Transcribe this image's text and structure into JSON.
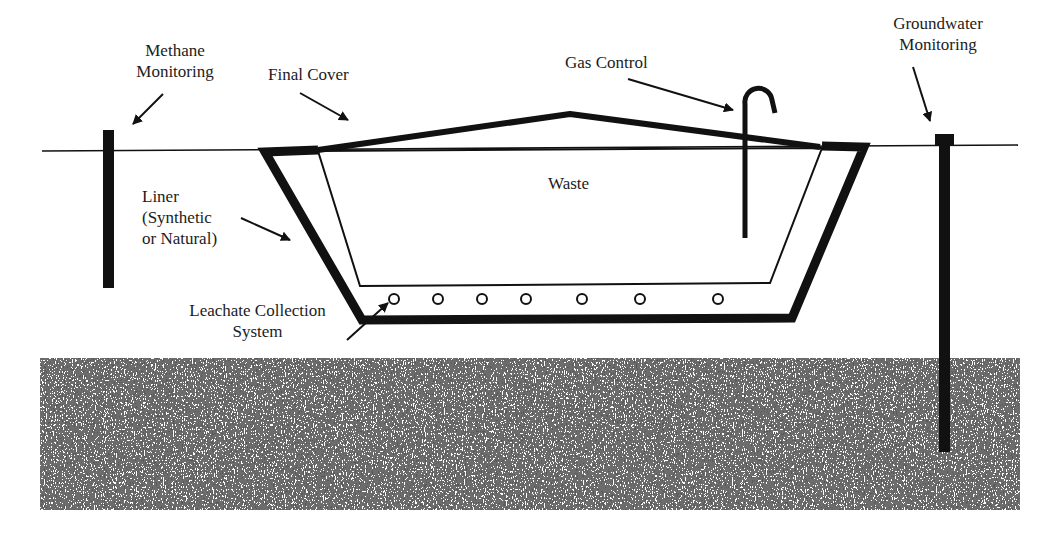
{
  "diagram": {
    "colors": {
      "ink": "#111111",
      "soil_dark": "#3a3a3a",
      "soil_light": "#f2f2f2",
      "background": "#ffffff"
    },
    "labels": {
      "methane_monitoring": {
        "line1": "Methane",
        "line2": "Monitoring"
      },
      "final_cover": "Final Cover",
      "gas_control": "Gas Control",
      "groundwater_monitoring": {
        "line1": "Groundwater",
        "line2": "Monitoring"
      },
      "waste": "Waste",
      "liner": {
        "line1": "Liner",
        "line2": "(Synthetic",
        "line3": "or Natural)"
      },
      "leachate_collection": {
        "line1": "Leachate Collection",
        "line2": "System"
      }
    },
    "leachate_pipes_count": 6,
    "components": [
      "ground-surface-line",
      "methane-monitoring-probe",
      "final-cover",
      "gas-control-vent",
      "groundwater-monitoring-well",
      "landfill-liner",
      "waste-cell",
      "leachate-collection-pipes",
      "soil-stratum"
    ]
  }
}
